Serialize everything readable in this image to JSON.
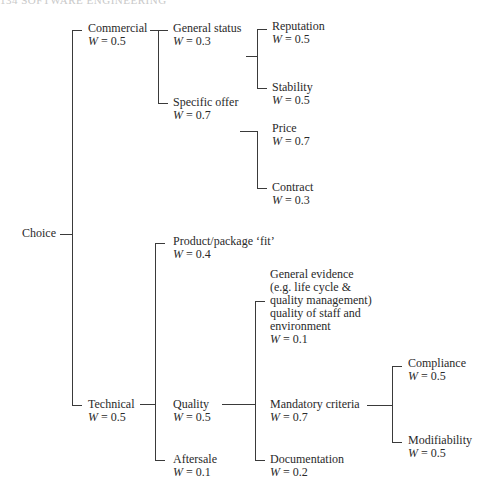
{
  "page_header": "134  SOFTWARE ENGINEERING",
  "tree": {
    "root": {
      "label": "Choice"
    },
    "commercial": {
      "label": "Commercial",
      "weight": "= 0.5"
    },
    "general_status": {
      "label": "General status",
      "weight": "= 0.3"
    },
    "reputation": {
      "label": "Reputation",
      "weight": "= 0.5"
    },
    "stability": {
      "label": "Stability",
      "weight": "= 0.5"
    },
    "specific_offer": {
      "label": "Specific offer",
      "weight": "= 0.7"
    },
    "price": {
      "label": "Price",
      "weight": "= 0.7"
    },
    "contract": {
      "label": "Contract",
      "weight": "= 0.3"
    },
    "technical": {
      "label": "Technical",
      "weight": "= 0.5"
    },
    "product_fit": {
      "label": "Product/package ‘fit’",
      "weight": "= 0.4"
    },
    "quality": {
      "label": "Quality",
      "weight": "= 0.5"
    },
    "general_evidence": {
      "lines": [
        "General evidence",
        "(e.g. life cycle &",
        "quality management)",
        "quality of staff and",
        "environment"
      ],
      "weight": "= 0.1"
    },
    "mandatory": {
      "label": "Mandatory criteria",
      "weight": "= 0.7"
    },
    "compliance": {
      "label": "Compliance",
      "weight": "= 0.5"
    },
    "modifiability": {
      "label": "Modifiability",
      "weight": "= 0.5"
    },
    "documentation": {
      "label": "Documentation",
      "weight": "= 0.2"
    },
    "aftersale": {
      "label": "Aftersale",
      "weight": "= 0.1"
    }
  },
  "weight_symbol": "W"
}
